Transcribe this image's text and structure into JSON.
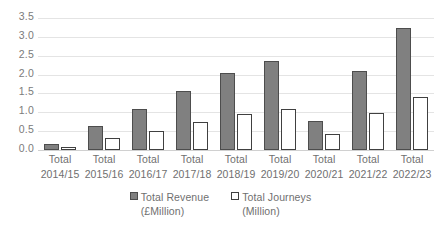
{
  "chart_data": {
    "type": "bar",
    "title": "",
    "subtitle": "",
    "xlabel": "",
    "ylabel": "",
    "ylim": [
      0,
      3.5
    ],
    "ytick_labels": [
      "3.5",
      "3.0",
      "2.5",
      "2.0",
      "1.5",
      "1.0",
      "0.5",
      "0.0"
    ],
    "ytick_values": [
      3.5,
      3.0,
      2.5,
      2.0,
      1.5,
      1.0,
      0.5,
      0.0
    ],
    "grid": true,
    "legend_position": "bottom",
    "categories": [
      "Total 2014/15",
      "Total 2015/16",
      "Total 2016/17",
      "Total 2017/18",
      "Total 2018/19",
      "Total 2019/20",
      "Total 2020/21",
      "Total 2021/22",
      "Total 2022/23"
    ],
    "category_lines": [
      [
        "Total",
        "2014/15"
      ],
      [
        "Total",
        "2015/16"
      ],
      [
        "Total",
        "2016/17"
      ],
      [
        "Total",
        "2017/18"
      ],
      [
        "Total",
        "2018/19"
      ],
      [
        "Total",
        "2019/20"
      ],
      [
        "Total",
        "2020/21"
      ],
      [
        "Total",
        "2021/22"
      ],
      [
        "Total",
        "2022/23"
      ]
    ],
    "series": [
      {
        "name": "Total Revenue",
        "unit": "(£Million)",
        "color": "#808080",
        "border": "#4d4d4d",
        "values": [
          0.16,
          0.64,
          1.1,
          1.56,
          2.03,
          2.35,
          0.77,
          2.09,
          3.23
        ]
      },
      {
        "name": "Total Journeys",
        "unit": "(Million)",
        "color": "#ffffff",
        "border": "#404040",
        "values": [
          0.07,
          0.31,
          0.51,
          0.73,
          0.95,
          1.09,
          0.42,
          0.99,
          1.41
        ]
      }
    ]
  },
  "legend": {
    "items": [
      {
        "label": "Total Revenue",
        "unit": "(£Million)"
      },
      {
        "label": "Total Journeys",
        "unit": "(Million)"
      }
    ]
  }
}
